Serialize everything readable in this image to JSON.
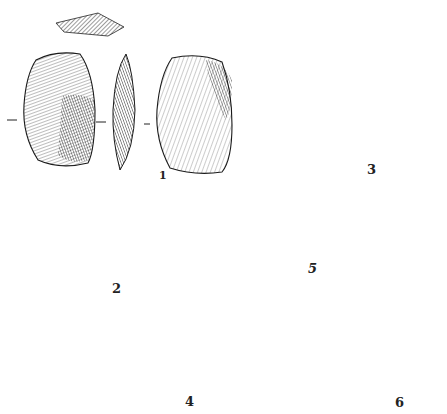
{
  "plate": {
    "subject": "Stone tool (lithic artifact) illustrations",
    "figures": [
      {
        "number": "1",
        "views": [
          "cross-section",
          "dorsal",
          "profile",
          "ventral"
        ]
      },
      {
        "number": "2",
        "views": [
          "dorsal",
          "profile",
          "ventral"
        ]
      },
      {
        "number": "3",
        "views": [
          "cross-section",
          "dorsal",
          "profile",
          "ventral"
        ]
      },
      {
        "number": "4",
        "views": [
          "dorsal",
          "profile",
          "ventral"
        ]
      },
      {
        "number": "5",
        "views": [
          "dorsal",
          "profile"
        ]
      },
      {
        "number": "6",
        "views": [
          "cross-section",
          "dorsal",
          "profile"
        ]
      }
    ]
  },
  "labels": {
    "fig1": "1",
    "fig2": "2",
    "fig3": "3",
    "fig4": "4",
    "fig5": "5",
    "fig6": "6"
  },
  "colors": {
    "ink": "#1a1a1a",
    "paper": "#ffffff"
  }
}
